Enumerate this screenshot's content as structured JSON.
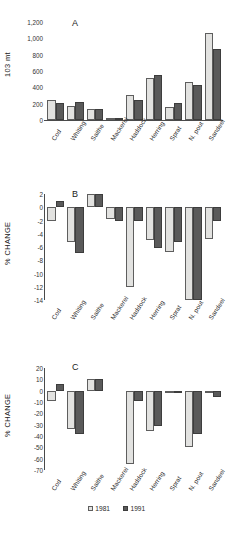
{
  "figure": {
    "legend": [
      {
        "label": "1981",
        "series_key": "y1981",
        "color": "#e2e2e0"
      },
      {
        "label": "1991",
        "series_key": "y1991",
        "color": "#5a5a5a"
      }
    ]
  },
  "chart_data": [
    {
      "type": "bar",
      "panel": "A",
      "title": "A",
      "xlabel": "",
      "ylabel": "103 mt",
      "categories": [
        "Cod",
        "Whiting",
        "Saithe",
        "Mackerel",
        "Haddock",
        "Herring",
        "Sprat",
        "N. pout",
        "Sandeel"
      ],
      "yticks": [
        0,
        200,
        400,
        600,
        800,
        1000,
        1200
      ],
      "yticklabels": [
        "0",
        "200",
        "400",
        "600",
        "800",
        "1,000",
        "1,200"
      ],
      "ylim": [
        0,
        1200
      ],
      "grid": false,
      "legend_position": "figure-bottom-center",
      "series": [
        {
          "name": "1981",
          "values": [
            245,
            175,
            135,
            20,
            305,
            510,
            160,
            470,
            1070
          ]
        },
        {
          "name": "1991",
          "values": [
            205,
            215,
            135,
            25,
            240,
            550,
            205,
            425,
            865
          ]
        }
      ]
    },
    {
      "type": "bar",
      "panel": "B",
      "title": "B",
      "xlabel": "",
      "ylabel": "% CHANGE",
      "categories": [
        "Cod",
        "Whiting",
        "Saithe",
        "Mackerel",
        "Haddock",
        "Herring",
        "Sprat",
        "N. pout",
        "Sandeel"
      ],
      "yticks": [
        2,
        0,
        -2,
        -4,
        -6,
        -8,
        -10,
        -12,
        -14
      ],
      "yticklabels": [
        "2",
        "0",
        "-2",
        "-4",
        "-6",
        "-8",
        "-10",
        "-12",
        "-14"
      ],
      "ylim": [
        -14,
        2
      ],
      "grid": false,
      "legend_position": "figure-bottom-center",
      "series": [
        {
          "name": "1981",
          "values": [
            -2.0,
            -5.2,
            2.0,
            -1.8,
            -12.1,
            -5.0,
            -6.8,
            -14.0,
            -4.8
          ]
        },
        {
          "name": "1991",
          "values": [
            1.0,
            -6.9,
            2.0,
            -2.0,
            -2.0,
            -6.2,
            -5.2,
            -14.0,
            -2.0
          ]
        }
      ]
    },
    {
      "type": "bar",
      "panel": "C",
      "title": "C",
      "xlabel": "",
      "ylabel": "% CHANGE",
      "categories": [
        "Cod",
        "Whiting",
        "Saithe",
        "Mackerel",
        "Haddock",
        "Herring",
        "Sprat",
        "N. pout",
        "Sandeel"
      ],
      "yticks": [
        20,
        10,
        0,
        -10,
        -20,
        -30,
        -40,
        -50,
        -60,
        -70
      ],
      "yticklabels": [
        "20",
        "10",
        "0",
        "-10",
        "-20",
        "-30",
        "-40",
        "-50",
        "-60",
        "-70"
      ],
      "ylim": [
        -70,
        20
      ],
      "grid": false,
      "legend_position": "figure-bottom-center",
      "series": [
        {
          "name": "1981",
          "values": [
            -9,
            -34,
            10,
            null,
            -65,
            -36,
            -2,
            -50,
            0
          ]
        },
        {
          "name": "1991",
          "values": [
            6,
            -38,
            10,
            null,
            -9,
            -31,
            0,
            -38,
            -6
          ]
        }
      ]
    }
  ]
}
